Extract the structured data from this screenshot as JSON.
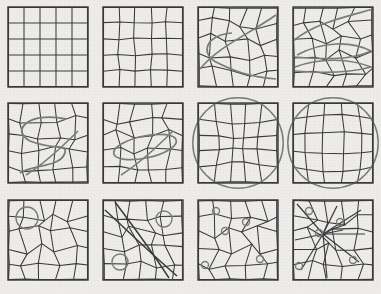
{
  "figure": {
    "background_color": "#edecea",
    "line_color": "#3a3a3a",
    "overlay_color": "#7b7b78",
    "panel_size": 80,
    "columns": 4,
    "rows": 3,
    "panels": [
      {
        "id": "panel-1",
        "index": 1,
        "row": 1,
        "col": 1,
        "x": 8,
        "y": 7,
        "label": "regular-grid",
        "caption": "Undistorted 5x5 regular grid",
        "grid_divisions": 5,
        "jitter": 0.0,
        "warp": "none",
        "overlays": []
      },
      {
        "id": "panel-2",
        "index": 2,
        "row": 1,
        "col": 2,
        "x": 103,
        "y": 7,
        "label": "slightly-perturbed-grid",
        "caption": "Grid with small node displacement",
        "grid_divisions": 5,
        "jitter": 0.1,
        "warp": "none",
        "overlays": []
      },
      {
        "id": "panel-3",
        "index": 3,
        "row": 1,
        "col": 3,
        "x": 198,
        "y": 7,
        "label": "warped-grid-with-curves",
        "caption": "Moderately warped grid with two traversing curves",
        "grid_divisions": 5,
        "jitter": 0.3,
        "warp": "moderate",
        "overlays": [
          "curve-diagonal",
          "curve-loop-left"
        ]
      },
      {
        "id": "panel-4",
        "index": 4,
        "row": 1,
        "col": 4,
        "x": 293,
        "y": 7,
        "label": "strongly-warped-grid",
        "caption": "Strongly warped grid with stacked horizontal curves",
        "grid_divisions": 5,
        "jitter": 0.38,
        "warp": "strong",
        "overlays": [
          "curve-sweep-top",
          "curve-sweep-mid",
          "curve-sweep-low"
        ]
      },
      {
        "id": "panel-5",
        "index": 5,
        "row": 2,
        "col": 1,
        "x": 8,
        "y": 103,
        "label": "grid-with-s-curve",
        "caption": "Irregular grid overlaid by a large S-shaped curve",
        "grid_divisions": 5,
        "jitter": 0.34,
        "warp": "irregular",
        "overlays": [
          "curve-s-shape",
          "curve-short-diagonal"
        ]
      },
      {
        "id": "panel-6",
        "index": 6,
        "row": 2,
        "col": 2,
        "x": 103,
        "y": 103,
        "label": "grid-with-ellipse",
        "caption": "Irregular grid overlaid by a tilted ellipse and a diagonal stroke",
        "grid_divisions": 5,
        "jitter": 0.34,
        "warp": "irregular",
        "overlays": [
          "ellipse-tilted",
          "curve-short-diagonal"
        ]
      },
      {
        "id": "panel-7",
        "index": 7,
        "row": 2,
        "col": 3,
        "x": 198,
        "y": 103,
        "label": "pinch-distortion",
        "caption": "Grid pinched toward centre with a large bounding circle",
        "grid_divisions": 5,
        "jitter": 0.05,
        "warp": "pinch",
        "warp_strength": -0.55,
        "overlays": [
          "circle-large"
        ]
      },
      {
        "id": "panel-8",
        "index": 8,
        "row": 2,
        "col": 4,
        "x": 293,
        "y": 103,
        "label": "bulge-distortion",
        "caption": "Grid bulged outward from centre with a large bounding circle",
        "grid_divisions": 5,
        "jitter": 0.04,
        "warp": "bulge",
        "warp_strength": 0.5,
        "overlays": [
          "circle-large"
        ]
      },
      {
        "id": "panel-9",
        "index": 9,
        "row": 3,
        "col": 1,
        "x": 8,
        "y": 200,
        "label": "grid-one-marker-circle",
        "caption": "Coarse irregular grid with one medium marker circle at upper left",
        "grid_divisions": 5,
        "jitter": 0.4,
        "warp": "irregular",
        "overlays": [
          "marker-circle"
        ],
        "markers": [
          {
            "cx": 19,
            "cy": 18,
            "r": 11
          }
        ]
      },
      {
        "id": "panel-10",
        "index": 10,
        "row": 3,
        "col": 2,
        "x": 103,
        "y": 200,
        "label": "grid-two-marker-circles",
        "caption": "Grid with steep diagonal bundle and two medium marker circles",
        "grid_divisions": 5,
        "jitter": 0.36,
        "warp": "shear",
        "overlays": [
          "marker-circle",
          "diagonal-bundle"
        ],
        "markers": [
          {
            "cx": 61,
            "cy": 19,
            "r": 8
          },
          {
            "cx": 17,
            "cy": 62,
            "r": 8
          }
        ]
      },
      {
        "id": "panel-11",
        "index": 11,
        "row": 3,
        "col": 3,
        "x": 198,
        "y": 200,
        "label": "grid-five-small-markers",
        "caption": "Irregular polygonal grid with five small marker circles",
        "grid_divisions": 5,
        "jitter": 0.42,
        "warp": "irregular",
        "overlays": [
          "marker-circle"
        ],
        "markers": [
          {
            "cx": 18,
            "cy": 11,
            "r": 3.5
          },
          {
            "cx": 48,
            "cy": 22,
            "r": 3.5
          },
          {
            "cx": 27,
            "cy": 31,
            "r": 3.5
          },
          {
            "cx": 62,
            "cy": 59,
            "r": 3.5
          },
          {
            "cx": 7,
            "cy": 65,
            "r": 3.5
          }
        ]
      },
      {
        "id": "panel-12",
        "index": 12,
        "row": 3,
        "col": 4,
        "x": 293,
        "y": 200,
        "label": "grid-converging-markers",
        "caption": "Grid with lines converging on a central node and four small marker circles",
        "grid_divisions": 5,
        "jitter": 0.42,
        "warp": "convergent",
        "overlays": [
          "marker-circle",
          "convergence-fan"
        ],
        "markers": [
          {
            "cx": 16,
            "cy": 11,
            "r": 3.5
          },
          {
            "cx": 47,
            "cy": 22,
            "r": 3.5
          },
          {
            "cx": 26,
            "cy": 33,
            "r": 3.5
          },
          {
            "cx": 60,
            "cy": 60,
            "r": 3.5
          },
          {
            "cx": 6,
            "cy": 66,
            "r": 3.5
          }
        ]
      }
    ]
  },
  "chart_data": {
    "type": "line",
    "xlabel": "",
    "ylabel": "",
    "grid": true,
    "legend_position": "none",
    "categories": [
      "regular-grid",
      "slightly-perturbed-grid",
      "warped-grid-with-curves",
      "strongly-warped-grid",
      "grid-with-s-curve",
      "grid-with-ellipse",
      "pinch-distortion",
      "bulge-distortion",
      "grid-one-marker-circle",
      "grid-two-marker-circles",
      "grid-five-small-markers",
      "grid-converging-markers"
    ],
    "series": [
      {
        "name": "node jitter amount",
        "values": [
          0.0,
          0.1,
          0.3,
          0.38,
          0.34,
          0.34,
          0.05,
          0.04,
          0.4,
          0.36,
          0.42,
          0.42
        ]
      },
      {
        "name": "overlay circle count",
        "values": [
          0,
          0,
          0,
          0,
          0,
          1,
          1,
          1,
          1,
          2,
          5,
          5
        ]
      }
    ],
    "ylim": [
      0,
      5
    ]
  }
}
